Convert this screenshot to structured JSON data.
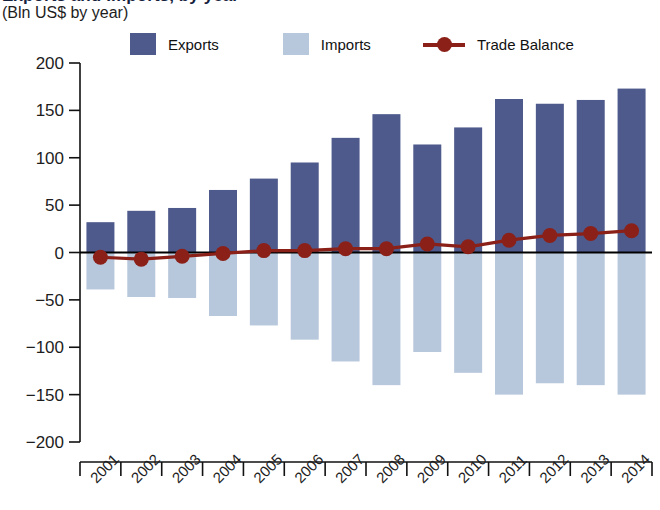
{
  "chart_data": {
    "type": "bar",
    "title": "Exports and Imports, by year",
    "subtitle": "(Bln US$ by year)",
    "xlabel": "",
    "ylabel": "",
    "ylim": [
      -200,
      200
    ],
    "ytick_step": 50,
    "grid": false,
    "legend_position": "top",
    "categories": [
      "2001",
      "2002",
      "2003",
      "2004",
      "2005",
      "2006",
      "2007",
      "2008",
      "2009",
      "2010",
      "2011",
      "2012",
      "2013",
      "2014"
    ],
    "yticks": [
      "200",
      "150",
      "100",
      "50",
      "0",
      "−50",
      "−100",
      "−150",
      "−200"
    ],
    "ytick_values": [
      200,
      150,
      100,
      50,
      0,
      -50,
      -100,
      -150,
      -200
    ],
    "series": [
      {
        "name": "Exports",
        "type": "bar",
        "color": "#4e5a8c",
        "values": [
          32,
          44,
          47,
          66,
          78,
          95,
          121,
          146,
          114,
          132,
          162,
          157,
          161,
          173
        ]
      },
      {
        "name": "Imports",
        "type": "bar",
        "color": "#b8c8dc",
        "values": [
          -39,
          -47,
          -48,
          -67,
          -77,
          -92,
          -115,
          -140,
          -105,
          -127,
          -150,
          -138,
          -140,
          -150
        ]
      },
      {
        "name": "Trade Balance",
        "type": "line",
        "color": "#8b2018",
        "values": [
          -5,
          -7,
          -4,
          -1,
          2,
          2,
          4,
          4,
          9,
          6,
          13,
          18,
          20,
          23
        ]
      }
    ]
  },
  "legend": {
    "exports_label": "Exports",
    "imports_label": "Imports",
    "trade_balance_label": "Trade Balance"
  },
  "colors": {
    "exports": "#4e5a8c",
    "imports": "#b8c8dc",
    "trade_balance": "#8b2018",
    "axis": "#111111",
    "background": "#ffffff"
  }
}
